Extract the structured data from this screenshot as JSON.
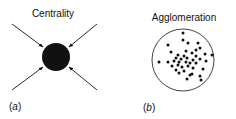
{
  "panels": [
    {
      "id": "a",
      "title": "Centrality",
      "label_prefix": "(",
      "label_letter": "a",
      "label_suffix": ")",
      "center": {
        "x": 56,
        "y": 57
      },
      "radius": 14,
      "arrows": [
        {
          "from": [
            12,
            24
          ],
          "to": [
            43,
            47
          ]
        },
        {
          "from": [
            97,
            24
          ],
          "to": [
            69,
            47
          ]
        },
        {
          "from": [
            12,
            90
          ],
          "to": [
            43,
            67
          ]
        },
        {
          "from": [
            97,
            90
          ],
          "to": [
            69,
            67
          ]
        }
      ]
    },
    {
      "id": "b",
      "title": "Agglomeration",
      "label_prefix": "(",
      "label_letter": "b",
      "label_suffix": ")",
      "center": {
        "x": 183,
        "y": 60
      },
      "radius": 31,
      "dots": [
        [
          183,
          33
        ],
        [
          183,
          40
        ],
        [
          188,
          43
        ],
        [
          168,
          45
        ],
        [
          198,
          43
        ],
        [
          200,
          48
        ],
        [
          196,
          50
        ],
        [
          171,
          52
        ],
        [
          186,
          51
        ],
        [
          192,
          53
        ],
        [
          178,
          55
        ],
        [
          184,
          56
        ],
        [
          196,
          56
        ],
        [
          205,
          54
        ],
        [
          212,
          55
        ],
        [
          176,
          58
        ],
        [
          181,
          59
        ],
        [
          187,
          58
        ],
        [
          193,
          60
        ],
        [
          200,
          59
        ],
        [
          159,
          62
        ],
        [
          168,
          62
        ],
        [
          174,
          61
        ],
        [
          179,
          62
        ],
        [
          186,
          62
        ],
        [
          190,
          63
        ],
        [
          196,
          63
        ],
        [
          206,
          61
        ],
        [
          172,
          66
        ],
        [
          178,
          65
        ],
        [
          182,
          67
        ],
        [
          188,
          66
        ],
        [
          193,
          68
        ],
        [
          176,
          70
        ],
        [
          184,
          71
        ],
        [
          203,
          69
        ],
        [
          179,
          73
        ],
        [
          190,
          75
        ],
        [
          192,
          74
        ],
        [
          200,
          76
        ],
        [
          187,
          79
        ],
        [
          201,
          80
        ]
      ]
    }
  ],
  "colors": {
    "ink": "#111111",
    "background": "#ffffff"
  }
}
